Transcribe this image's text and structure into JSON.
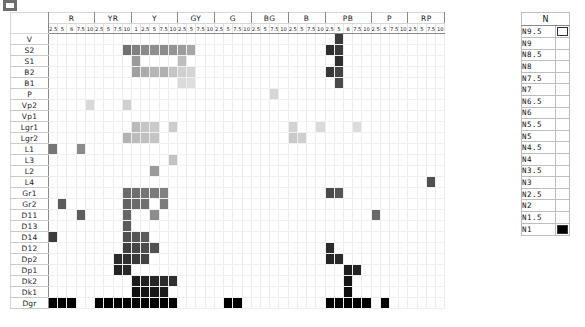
{
  "legend": {
    "title": "N",
    "items": [
      {
        "label": "N9.5",
        "color": "#ffffff"
      },
      {
        "label": "N9",
        "color": "#f2f2f2"
      },
      {
        "label": "N8.5",
        "color": "#e6e6e6"
      },
      {
        "label": "N8",
        "color": "#d9d9d9"
      },
      {
        "label": "N7.5",
        "color": "#cccccc"
      },
      {
        "label": "N7",
        "color": "#bfbfbf"
      },
      {
        "label": "N6.5",
        "color": "#b3b3b3"
      },
      {
        "label": "N6",
        "color": "#a6a6a6"
      },
      {
        "label": "N5.5",
        "color": "#999999"
      },
      {
        "label": "N5",
        "color": "#8c8c8c"
      },
      {
        "label": "N4.5",
        "color": "#808080"
      },
      {
        "label": "N4",
        "color": "#737373"
      },
      {
        "label": "N3.5",
        "color": "#666666"
      },
      {
        "label": "N3",
        "color": "#595959"
      },
      {
        "label": "N2.5",
        "color": "#4d4d4d"
      },
      {
        "label": "N2",
        "color": "#333333"
      },
      {
        "label": "N1.5",
        "color": "#1f1f1f"
      },
      {
        "label": "N1",
        "color": "#000000"
      }
    ]
  },
  "chart_data": {
    "type": "heatmap",
    "title": "",
    "xlabel": "",
    "ylabel": "",
    "grid": true,
    "legend_position": "right",
    "value_scale": "Munsell neutral value N1 (black) to N9.5 (white)",
    "hue_groups": [
      {
        "name": "R",
        "ticks": [
          "2.5",
          "5",
          "6",
          "7.5",
          "10"
        ]
      },
      {
        "name": "YR",
        "ticks": [
          "2.5",
          "5",
          "7.5",
          "10"
        ]
      },
      {
        "name": "Y",
        "ticks": [
          "1",
          "2.5",
          "5",
          "7.5",
          "10"
        ]
      },
      {
        "name": "GY",
        "ticks": [
          "2.5",
          "5",
          "7.5",
          "10"
        ]
      },
      {
        "name": "G",
        "ticks": [
          "2.5",
          "5",
          "7.5",
          "10"
        ]
      },
      {
        "name": "BG",
        "ticks": [
          "2.5",
          "5",
          "7.5",
          "10"
        ]
      },
      {
        "name": "B",
        "ticks": [
          "2.5",
          "5",
          "7.5",
          "10"
        ]
      },
      {
        "name": "PB",
        "ticks": [
          "2.5",
          "5",
          "6",
          "7.5",
          "10"
        ]
      },
      {
        "name": "P",
        "ticks": [
          "2.5",
          "5",
          "7.5",
          "10"
        ]
      },
      {
        "name": "RP",
        "ticks": [
          "2.5",
          "5",
          "7.5",
          "10"
        ]
      }
    ],
    "rows": [
      "V",
      "S2",
      "S1",
      "B2",
      "B1",
      "P",
      "Vp2",
      "Vp1",
      "Lgr1",
      "Lgr2",
      "L1",
      "L3",
      "L2",
      "L4",
      "Gr1",
      "Gr2",
      "D11",
      "D13",
      "D14",
      "D12",
      "Dp2",
      "Dp1",
      "Dk2",
      "Dk1",
      "Dgr"
    ],
    "cells": [
      {
        "row": "V",
        "col": 32,
        "color": "#3a3a3a"
      },
      {
        "row": "S2",
        "col": 9,
        "color": "#707070"
      },
      {
        "row": "S2",
        "col": 10,
        "color": "#808080"
      },
      {
        "row": "S2",
        "col": 11,
        "color": "#8a8a8a"
      },
      {
        "row": "S2",
        "col": 12,
        "color": "#8f8f8f"
      },
      {
        "row": "S2",
        "col": 13,
        "color": "#8c8c8c"
      },
      {
        "row": "S2",
        "col": 14,
        "color": "#949494"
      },
      {
        "row": "S2",
        "col": 15,
        "color": "#9c9c9c"
      },
      {
        "row": "S2",
        "col": 16,
        "color": "#a6a6a6"
      },
      {
        "row": "S2",
        "col": 31,
        "color": "#2e2e2e"
      },
      {
        "row": "S2",
        "col": 32,
        "color": "#3a3a3a"
      },
      {
        "row": "S1",
        "col": 10,
        "color": "#9a9a9a"
      },
      {
        "row": "S1",
        "col": 15,
        "color": "#bdbdbd"
      },
      {
        "row": "S1",
        "col": 32,
        "color": "#2e2e2e"
      },
      {
        "row": "B2",
        "col": 10,
        "color": "#a0a0a0"
      },
      {
        "row": "B2",
        "col": 11,
        "color": "#acacac"
      },
      {
        "row": "B2",
        "col": 12,
        "color": "#b5b5b5"
      },
      {
        "row": "B2",
        "col": 13,
        "color": "#b0b0b0"
      },
      {
        "row": "B2",
        "col": 14,
        "color": "#c4c4c4"
      },
      {
        "row": "B2",
        "col": 15,
        "color": "#cfcfcf"
      },
      {
        "row": "B2",
        "col": 16,
        "color": "#d4d4d4"
      },
      {
        "row": "B2",
        "col": 31,
        "color": "#373737"
      },
      {
        "row": "B2",
        "col": 32,
        "color": "#434343"
      },
      {
        "row": "B1",
        "col": 15,
        "color": "#dadada"
      },
      {
        "row": "B1",
        "col": 16,
        "color": "#dedede"
      },
      {
        "row": "B1",
        "col": 32,
        "color": "#4a4a4a"
      },
      {
        "row": "P",
        "col": 25,
        "color": "#d6d6d6"
      },
      {
        "row": "Vp2",
        "col": 5,
        "color": "#d9d9d9"
      },
      {
        "row": "Vp2",
        "col": 9,
        "color": "#d0d0d0"
      },
      {
        "row": "Lgr1",
        "col": 10,
        "color": "#b9b9b9"
      },
      {
        "row": "Lgr1",
        "col": 11,
        "color": "#c6c6c6"
      },
      {
        "row": "Lgr1",
        "col": 12,
        "color": "#cacaca"
      },
      {
        "row": "Lgr1",
        "col": 14,
        "color": "#cdcdcd"
      },
      {
        "row": "Lgr1",
        "col": 27,
        "color": "#d2d2d2"
      },
      {
        "row": "Lgr1",
        "col": 30,
        "color": "#dadada"
      },
      {
        "row": "Lgr1",
        "col": 34,
        "color": "#dcdcdc"
      },
      {
        "row": "Lgr2",
        "col": 9,
        "color": "#b3b3b3"
      },
      {
        "row": "Lgr2",
        "col": 10,
        "color": "#bcbcbc"
      },
      {
        "row": "Lgr2",
        "col": 11,
        "color": "#c0c0c0"
      },
      {
        "row": "Lgr2",
        "col": 12,
        "color": "#c4c4c4"
      },
      {
        "row": "Lgr2",
        "col": 27,
        "color": "#c9c9c9"
      },
      {
        "row": "Lgr2",
        "col": 28,
        "color": "#cfcfcf"
      },
      {
        "row": "L1",
        "col": 1,
        "color": "#767676"
      },
      {
        "row": "L1",
        "col": 4,
        "color": "#8a8a8a"
      },
      {
        "row": "L3",
        "col": 14,
        "color": "#c2c2c2"
      },
      {
        "row": "L2",
        "col": 12,
        "color": "#9a9a9a"
      },
      {
        "row": "L4",
        "col": 42,
        "color": "#4f4f4f"
      },
      {
        "row": "Gr1",
        "col": 9,
        "color": "#6b6b6b"
      },
      {
        "row": "Gr1",
        "col": 10,
        "color": "#6e6e6e"
      },
      {
        "row": "Gr1",
        "col": 11,
        "color": "#747474"
      },
      {
        "row": "Gr1",
        "col": 12,
        "color": "#7a7a7a"
      },
      {
        "row": "Gr1",
        "col": 13,
        "color": "#808080"
      },
      {
        "row": "Gr1",
        "col": 31,
        "color": "#4a4a4a"
      },
      {
        "row": "Gr1",
        "col": 32,
        "color": "#565656"
      },
      {
        "row": "Gr2",
        "col": 2,
        "color": "#5c5c5c"
      },
      {
        "row": "Gr2",
        "col": 9,
        "color": "#636363"
      },
      {
        "row": "Gr2",
        "col": 10,
        "color": "#6a6a6a"
      },
      {
        "row": "Gr2",
        "col": 11,
        "color": "#707070"
      },
      {
        "row": "Gr2",
        "col": 13,
        "color": "#7c7c7c"
      },
      {
        "row": "D11",
        "col": 4,
        "color": "#5e5e5e"
      },
      {
        "row": "D11",
        "col": 9,
        "color": "#666666"
      },
      {
        "row": "D11",
        "col": 12,
        "color": "#8d8d8d"
      },
      {
        "row": "D11",
        "col": 36,
        "color": "#6a6a6a"
      },
      {
        "row": "D13",
        "col": 9,
        "color": "#5a5a5a"
      },
      {
        "row": "D14",
        "col": 1,
        "color": "#3c3c3c"
      },
      {
        "row": "D14",
        "col": 9,
        "color": "#505050"
      },
      {
        "row": "D14",
        "col": 10,
        "color": "#565656"
      },
      {
        "row": "D14",
        "col": 11,
        "color": "#5c5c5c"
      },
      {
        "row": "D12",
        "col": 9,
        "color": "#3f3f3f"
      },
      {
        "row": "D12",
        "col": 10,
        "color": "#464646"
      },
      {
        "row": "D12",
        "col": 11,
        "color": "#4c4c4c"
      },
      {
        "row": "D12",
        "col": 12,
        "color": "#525252"
      },
      {
        "row": "D12",
        "col": 31,
        "color": "#2b2b2b"
      },
      {
        "row": "Dp2",
        "col": 8,
        "color": "#2c2c2c"
      },
      {
        "row": "Dp2",
        "col": 9,
        "color": "#303030"
      },
      {
        "row": "Dp2",
        "col": 10,
        "color": "#3a3a3a"
      },
      {
        "row": "Dp2",
        "col": 11,
        "color": "#424242"
      },
      {
        "row": "Dp2",
        "col": 31,
        "color": "#242424"
      },
      {
        "row": "Dp2",
        "col": 32,
        "color": "#2a2a2a"
      },
      {
        "row": "Dp1",
        "col": 8,
        "color": "#222222"
      },
      {
        "row": "Dp1",
        "col": 9,
        "color": "#282828"
      },
      {
        "row": "Dp1",
        "col": 33,
        "color": "#1d1d1d"
      },
      {
        "row": "Dp1",
        "col": 34,
        "color": "#232323"
      },
      {
        "row": "Dk2",
        "col": 10,
        "color": "#1a1a1a"
      },
      {
        "row": "Dk2",
        "col": 11,
        "color": "#202020"
      },
      {
        "row": "Dk2",
        "col": 12,
        "color": "#262626"
      },
      {
        "row": "Dk2",
        "col": 13,
        "color": "#2b2b2b"
      },
      {
        "row": "Dk2",
        "col": 14,
        "color": "#303030"
      },
      {
        "row": "Dk2",
        "col": 33,
        "color": "#151515"
      },
      {
        "row": "Dk1",
        "col": 10,
        "color": "#101010"
      },
      {
        "row": "Dk1",
        "col": 11,
        "color": "#141414"
      },
      {
        "row": "Dk1",
        "col": 12,
        "color": "#181818"
      },
      {
        "row": "Dk1",
        "col": 13,
        "color": "#1c1c1c"
      },
      {
        "row": "Dk1",
        "col": 33,
        "color": "#0d0d0d"
      },
      {
        "row": "Dgr",
        "col": 1,
        "color": "#000000"
      },
      {
        "row": "Dgr",
        "col": 2,
        "color": "#000000"
      },
      {
        "row": "Dgr",
        "col": 3,
        "color": "#000000"
      },
      {
        "row": "Dgr",
        "col": 6,
        "color": "#000000"
      },
      {
        "row": "Dgr",
        "col": 7,
        "color": "#000000"
      },
      {
        "row": "Dgr",
        "col": 8,
        "color": "#000000"
      },
      {
        "row": "Dgr",
        "col": 9,
        "color": "#000000"
      },
      {
        "row": "Dgr",
        "col": 10,
        "color": "#000000"
      },
      {
        "row": "Dgr",
        "col": 11,
        "color": "#000000"
      },
      {
        "row": "Dgr",
        "col": 12,
        "color": "#000000"
      },
      {
        "row": "Dgr",
        "col": 13,
        "color": "#000000"
      },
      {
        "row": "Dgr",
        "col": 14,
        "color": "#000000"
      },
      {
        "row": "Dgr",
        "col": 20,
        "color": "#000000"
      },
      {
        "row": "Dgr",
        "col": 21,
        "color": "#000000"
      },
      {
        "row": "Dgr",
        "col": 31,
        "color": "#000000"
      },
      {
        "row": "Dgr",
        "col": 32,
        "color": "#000000"
      },
      {
        "row": "Dgr",
        "col": 33,
        "color": "#000000"
      },
      {
        "row": "Dgr",
        "col": 34,
        "color": "#000000"
      },
      {
        "row": "Dgr",
        "col": 35,
        "color": "#000000"
      },
      {
        "row": "Dgr",
        "col": 37,
        "color": "#000000"
      }
    ]
  }
}
